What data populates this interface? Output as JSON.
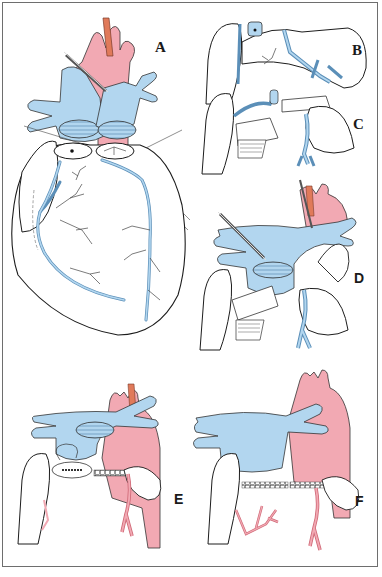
{
  "figure": {
    "type": "surgical-illustration",
    "panels": [
      {
        "id": "A",
        "label": "A"
      },
      {
        "id": "B",
        "label": "B"
      },
      {
        "id": "C",
        "label": "C"
      },
      {
        "id": "D",
        "label": "D"
      },
      {
        "id": "E",
        "label": "E"
      },
      {
        "id": "F",
        "label": "F"
      }
    ]
  },
  "colors": {
    "artery": "#f2a9b3",
    "vein": "#b2d6ef",
    "vein_stroke": "#5b8fb8",
    "outline": "#1c1c1c",
    "nerve": "#e07a5a",
    "frame": "#6e6e6e"
  }
}
